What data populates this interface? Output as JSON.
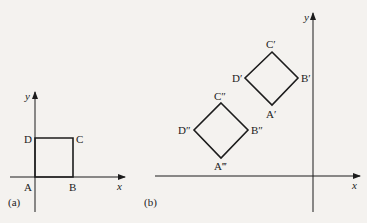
{
  "figure": {
    "panel_a": {
      "caption": "(a)",
      "axis_x_label": "x",
      "axis_y_label": "y",
      "vertices": {
        "A": "A",
        "B": "B",
        "C": "C",
        "D": "D"
      }
    },
    "panel_b": {
      "caption": "(b)",
      "axis_x_label": "x",
      "axis_y_label": "y",
      "upper_square": {
        "A": "A′",
        "B": "B′",
        "C": "C′",
        "D": "D′"
      },
      "lower_square": {
        "A": "A‴",
        "B": "B″",
        "C": "C″",
        "D": "D″"
      }
    }
  }
}
